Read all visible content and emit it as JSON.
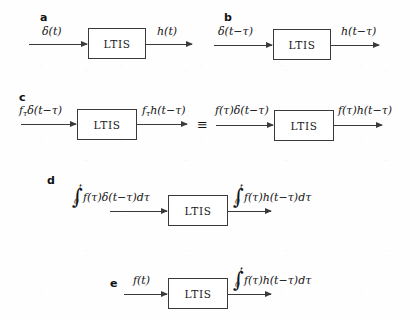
{
  "figure": {
    "block_label": "LTIS",
    "equivalence_symbol": "≡",
    "ink_color": "#3a3a3a",
    "background_color": "#ffffff",
    "panels": [
      {
        "letter": "a",
        "input": "δ(t)",
        "output": "h(t)",
        "block": "LTIS"
      },
      {
        "letter": "b",
        "input": "δ(t−τ)",
        "output": "h(t−τ)",
        "block": "LTIS"
      },
      {
        "letter": "c",
        "block": "LTIS",
        "left": {
          "input_main": "δ(t−τ)",
          "input_coef": "f",
          "input_coef_sub": "τ",
          "output_main": "h(t−τ)",
          "output_coef": "f",
          "output_coef_sub": "τ"
        },
        "equivalence": "≡",
        "right": {
          "input": "f(τ)δ(t−τ)",
          "output": "f(τ)h(t−τ)"
        }
      },
      {
        "letter": "d",
        "block": "LTIS",
        "input_integrand": "f(τ)δ(t−τ)dτ",
        "input_limit_upper": "t",
        "input_limit_lower": "0",
        "output_integrand": "f(τ)h(t−τ)dτ",
        "output_limit_upper": "t",
        "output_limit_lower": "0"
      },
      {
        "letter": "e",
        "block": "LTIS",
        "input": "f(t)",
        "output_integrand": "f(τ)h(t−τ)dτ",
        "output_limit_upper": "t",
        "output_limit_lower": "0"
      }
    ]
  }
}
